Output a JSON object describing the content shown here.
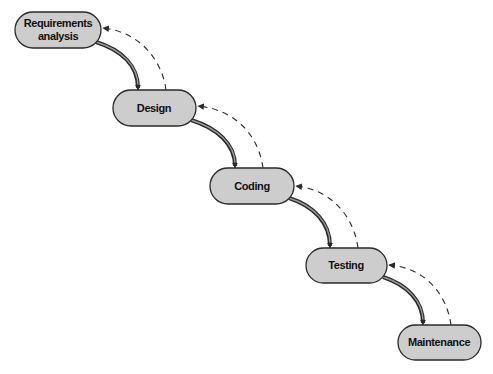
{
  "diagram": {
    "colors": {
      "node_fill": "#cdcdcd",
      "node_stroke": "#2a2a2a",
      "text": "#111111",
      "arrow": "#2a2a2a",
      "background": "#ffffff"
    },
    "nodes": [
      {
        "id": "requirements",
        "label_line1": "Requirements",
        "label_line2": "analysis",
        "x": 15,
        "y": 12,
        "w": 86,
        "h": 36
      },
      {
        "id": "design",
        "label": "Design",
        "x": 113,
        "y": 90,
        "w": 83,
        "h": 36
      },
      {
        "id": "coding",
        "label": "Coding",
        "x": 210,
        "y": 168,
        "w": 84,
        "h": 36
      },
      {
        "id": "testing",
        "label": "Testing",
        "x": 306,
        "y": 248,
        "w": 81,
        "h": 35
      },
      {
        "id": "maintenance",
        "label": "Maintenance",
        "x": 398,
        "y": 325,
        "w": 83,
        "h": 35
      }
    ],
    "edges": [
      {
        "from": "requirements",
        "to": "design",
        "style": "solid-double",
        "direction": "forward"
      },
      {
        "from": "design",
        "to": "requirements",
        "style": "dashed",
        "direction": "feedback"
      },
      {
        "from": "design",
        "to": "coding",
        "style": "solid-double",
        "direction": "forward"
      },
      {
        "from": "coding",
        "to": "design",
        "style": "dashed",
        "direction": "feedback"
      },
      {
        "from": "coding",
        "to": "testing",
        "style": "solid-double",
        "direction": "forward"
      },
      {
        "from": "testing",
        "to": "coding",
        "style": "dashed",
        "direction": "feedback"
      },
      {
        "from": "testing",
        "to": "maintenance",
        "style": "solid-double",
        "direction": "forward"
      },
      {
        "from": "maintenance",
        "to": "testing",
        "style": "dashed",
        "direction": "feedback"
      }
    ]
  }
}
